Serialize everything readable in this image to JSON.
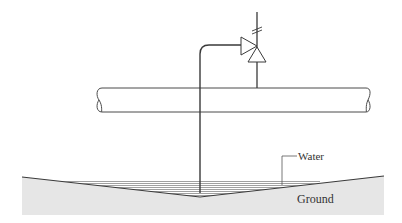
{
  "diagram": {
    "labels": {
      "water": "Water",
      "ground": "Ground"
    },
    "components": [
      {
        "name": "valve",
        "symbol": "check-valve-triangles"
      },
      {
        "name": "pipe",
        "symbol": "horizontal-pipe-broken-ends"
      },
      {
        "name": "siphon-tube",
        "symbol": "bent-tube"
      },
      {
        "name": "water",
        "symbol": "hatched-lines"
      },
      {
        "name": "ground",
        "symbol": "shaded-fill"
      }
    ],
    "colors": {
      "line": "#3a3a3a",
      "ground_fill": "#e6e6e6",
      "water_line": "#777777",
      "background": "#ffffff"
    }
  }
}
